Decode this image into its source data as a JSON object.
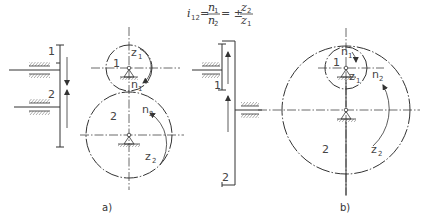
{
  "formula": {
    "lhs": "i",
    "lhs_sub": "12",
    "eq1": "=",
    "frac1_num": "n",
    "frac1_num_sub": "1",
    "frac1_den": "n",
    "frac1_den_sub": "2",
    "eq2": "= ±",
    "frac2_num": "z",
    "frac2_num_sub": "2",
    "frac2_den": "z",
    "frac2_den_sub": "1"
  },
  "figure_a": {
    "caption": "a)",
    "side_view": {
      "label_1": "1",
      "label_2": "2"
    },
    "gear_1": {
      "number": "1",
      "teeth_label": "z",
      "teeth_sub": "1",
      "speed_label": "n",
      "speed_sub": "1"
    },
    "gear_2": {
      "number": "2",
      "teeth_label": "z",
      "teeth_sub": "2",
      "speed_label": "n",
      "speed_sub": "2"
    }
  },
  "figure_b": {
    "caption": "b)",
    "side_view": {
      "label_1": "1",
      "label_2": "2"
    },
    "gear_1": {
      "number": "1",
      "teeth_label": "z",
      "teeth_sub": "1",
      "speed_label": "n",
      "speed_sub": "1"
    },
    "gear_2": {
      "number": "2",
      "teeth_label": "z",
      "teeth_sub": "2",
      "speed_label": "n",
      "speed_sub": "2"
    }
  },
  "colors": {
    "line": "#333333",
    "background": "#ffffff"
  }
}
